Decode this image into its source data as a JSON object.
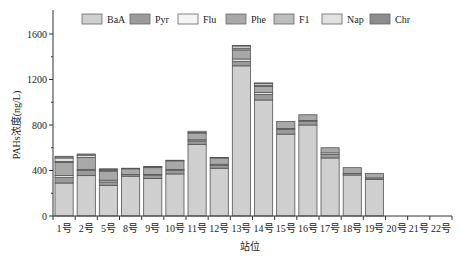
{
  "chart_data": {
    "type": "bar",
    "stacked": true,
    "title": "",
    "xlabel": "站位",
    "ylabel": "PAHs浓度(ng/L)",
    "ylim": [
      0,
      1800
    ],
    "yticks": [
      0,
      400,
      800,
      1200,
      1600
    ],
    "grid": false,
    "legend_position": "top-inside",
    "categories": [
      "1号",
      "2号",
      "5号",
      "8号",
      "9号",
      "10号",
      "11号",
      "12号",
      "13号",
      "14号",
      "15号",
      "16号",
      "17号",
      "18号",
      "19号",
      "20号",
      "21号",
      "22号"
    ],
    "series": [
      {
        "name": "BaA",
        "color": "#cfcfcf",
        "values": [
          290,
          355,
          270,
          350,
          330,
          370,
          630,
          420,
          1320,
          1020,
          720,
          800,
          510,
          360,
          320,
          0,
          0,
          0
        ]
      },
      {
        "name": "Pyr",
        "color": "#9a9a9a",
        "values": [
          50,
          45,
          30,
          15,
          30,
          30,
          30,
          25,
          40,
          50,
          40,
          30,
          30,
          15,
          15,
          0,
          0,
          0
        ]
      },
      {
        "name": "Flu",
        "color": "#f4f4f4",
        "values": [
          15,
          10,
          15,
          0,
          5,
          10,
          10,
          10,
          20,
          15,
          10,
          10,
          15,
          0,
          0,
          0,
          0,
          0
        ]
      },
      {
        "name": "Phe",
        "color": "#a8a8a8",
        "values": [
          115,
          105,
          80,
          50,
          60,
          75,
          60,
          55,
          80,
          55,
          60,
          50,
          45,
          50,
          40,
          0,
          0,
          0
        ]
      },
      {
        "name": "F1",
        "color": "#bdbdbd",
        "values": [
          10,
          0,
          5,
          0,
          5,
          0,
          5,
          5,
          15,
          10,
          0,
          0,
          0,
          0,
          0,
          0,
          0,
          0
        ]
      },
      {
        "name": "Nap",
        "color": "#e2e2e2",
        "values": [
          30,
          20,
          10,
          5,
          5,
          5,
          10,
          0,
          20,
          15,
          0,
          0,
          0,
          0,
          0,
          0,
          0,
          0
        ]
      },
      {
        "name": "Chr",
        "color": "#8c8c8c",
        "values": [
          15,
          10,
          5,
          0,
          0,
          0,
          0,
          0,
          5,
          5,
          0,
          0,
          0,
          0,
          0,
          0,
          0,
          0
        ]
      }
    ]
  }
}
